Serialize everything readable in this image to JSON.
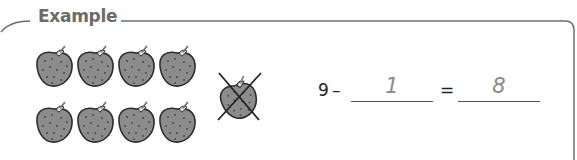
{
  "section": {
    "title": "Example"
  },
  "illustration": {
    "strawberry_count": 9,
    "rows": [
      {
        "count": 4
      },
      {
        "count": 4
      }
    ],
    "crossed_out_count": 1
  },
  "equation": {
    "minuend": "9",
    "operator": "–",
    "subtrahend_answer": "1",
    "equals": "=",
    "difference_answer": "8"
  },
  "colors": {
    "border": "#6e6e6e",
    "title": "#6b6b6b",
    "strawberry_fill": "#8c8c8c",
    "answer_text": "#8a8a8a"
  }
}
